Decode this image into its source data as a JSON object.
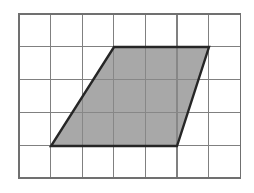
{
  "figure": {
    "background_color": "#ffffff",
    "canvas": {
      "width": 254,
      "height": 193
    }
  },
  "grid": {
    "name": "square-grid",
    "columns": 7,
    "rows": 5,
    "origin_x": 19,
    "origin_y": 14,
    "cell_width": 31.6,
    "cell_height": 32.8,
    "line_color": "#808080",
    "line_width": 1.2,
    "outer_line_color": "#707070",
    "outer_line_width": 1.4,
    "fill": "#ffffff"
  },
  "shape": {
    "name": "parallelogram",
    "type": "parallelogram",
    "fill_color": "#a8a8a8",
    "stroke_color": "#262626",
    "stroke_width": 2.4,
    "points": "114,47 209,47 177,146 51,146",
    "vertices": [
      {
        "label": "top-left",
        "x": 114,
        "y": 47,
        "grid_x": 3.0,
        "grid_y": 1.0
      },
      {
        "label": "top-right",
        "x": 209,
        "y": 47,
        "grid_x": 6.0,
        "grid_y": 1.0
      },
      {
        "label": "bottom-right",
        "x": 177,
        "y": 146,
        "grid_x": 5.0,
        "grid_y": 4.0
      },
      {
        "label": "bottom-left",
        "x": 51,
        "y": 146,
        "grid_x": 1.0,
        "grid_y": 4.0
      }
    ],
    "measurements": {
      "base_cells": 4,
      "top_cells": 3,
      "height_cells": 3,
      "slant_offset_cells": 2
    }
  },
  "chart_data": {
    "type": "scatter",
    "xlabel": "",
    "ylabel": "",
    "xlim": [
      0,
      7
    ],
    "ylim": [
      0,
      5
    ],
    "grid": true,
    "legend": "none",
    "categories": [
      "top-left",
      "top-right",
      "bottom-right",
      "bottom-left"
    ],
    "x": [
      3.0,
      6.0,
      5.0,
      1.0
    ],
    "y": [
      4.0,
      4.0,
      1.0,
      1.0
    ],
    "annotations": [
      "shaded parallelogram",
      "7 by 5 unit grid"
    ]
  }
}
